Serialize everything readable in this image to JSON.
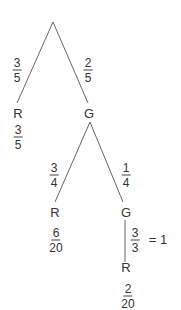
{
  "tree": {
    "level1": {
      "left": {
        "node": "R",
        "prob": {
          "num": "3",
          "den": "5"
        },
        "result": {
          "num": "3",
          "den": "5"
        }
      },
      "right": {
        "node": "G",
        "prob": {
          "num": "2",
          "den": "5"
        }
      }
    },
    "level2": {
      "left": {
        "node": "R",
        "prob": {
          "num": "3",
          "den": "4"
        },
        "result": {
          "num": "6",
          "den": "20"
        }
      },
      "right": {
        "node": "G",
        "prob": {
          "num": "1",
          "den": "4"
        }
      }
    },
    "level3": {
      "only": {
        "node": "R",
        "prob": {
          "num": "3",
          "den": "3"
        },
        "equals": "= 1",
        "result": {
          "num": "2",
          "den": "20"
        }
      }
    }
  },
  "colors": {
    "line": "#555555",
    "text": "#333333"
  }
}
